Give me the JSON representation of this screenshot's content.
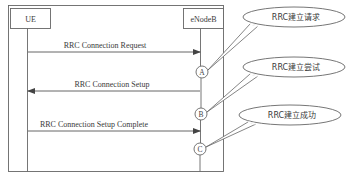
{
  "diagram": {
    "type": "sequence",
    "participants": [
      {
        "id": "ue",
        "label": "UE"
      },
      {
        "id": "enb",
        "label": "eNodeB"
      }
    ],
    "messages": [
      {
        "label": "RRC Connection Request",
        "from": "UE",
        "to": "eNodeB",
        "marker": "A"
      },
      {
        "label": "RRC Connection Setup",
        "from": "eNodeB",
        "to": "UE",
        "marker": "B"
      },
      {
        "label": "RRC Connection Setup Complete",
        "from": "UE",
        "to": "eNodeB",
        "marker": "C"
      }
    ],
    "callouts": [
      {
        "marker": "A",
        "text": "RRC建立请求"
      },
      {
        "marker": "B",
        "text": "RRC建立尝试"
      },
      {
        "marker": "C",
        "text": "RRC建立成功"
      }
    ],
    "colors": {
      "line": "#555555",
      "text": "#3a3a3a",
      "background": "#ffffff"
    }
  }
}
